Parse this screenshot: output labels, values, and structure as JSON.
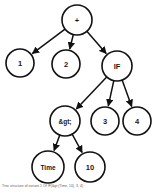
{
  "figure": {
    "type": "expression-tree",
    "caption": "Tree structure of variant 1 Of IF(&gt;(Time, 10), 3, 4)",
    "colors": {
      "node_fill": "#ffffff",
      "node_stroke": "#111111",
      "edge": "#111111",
      "label": "#1a1a1a",
      "background": "#ffffff"
    },
    "nodes": [
      {
        "id": "root",
        "label": "+",
        "cx": 77,
        "cy": 20,
        "r": 15
      },
      {
        "id": "n1",
        "label": "1",
        "cx": 20,
        "cy": 63,
        "r": 14
      },
      {
        "id": "n2",
        "label": "2",
        "cx": 66,
        "cy": 64,
        "r": 14
      },
      {
        "id": "nif",
        "label": "IF",
        "cx": 117,
        "cy": 66,
        "r": 15
      },
      {
        "id": "ngt",
        "label": "&gt;",
        "cx": 65,
        "cy": 121,
        "r": 15
      },
      {
        "id": "n3",
        "label": "3",
        "cx": 105,
        "cy": 121,
        "r": 14
      },
      {
        "id": "n4",
        "label": "4",
        "cx": 137,
        "cy": 121,
        "r": 14
      },
      {
        "id": "ntime",
        "label": "Time",
        "cx": 48,
        "cy": 167,
        "r": 16
      },
      {
        "id": "n10",
        "label": "10",
        "cx": 90,
        "cy": 167,
        "r": 15
      }
    ],
    "edges": [
      {
        "from": "root",
        "to": "n1"
      },
      {
        "from": "root",
        "to": "n2"
      },
      {
        "from": "root",
        "to": "nif"
      },
      {
        "from": "nif",
        "to": "ngt"
      },
      {
        "from": "nif",
        "to": "n3"
      },
      {
        "from": "nif",
        "to": "n4"
      },
      {
        "from": "ngt",
        "to": "ntime"
      },
      {
        "from": "ngt",
        "to": "n10"
      }
    ]
  }
}
